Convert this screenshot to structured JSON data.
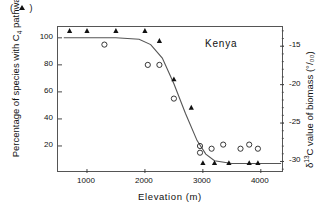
{
  "legend_marker": "( ▲ )",
  "title": "Kenya",
  "axes": {
    "x": {
      "label": "Elevation  (m)",
      "ticks": [
        "1000",
        "2000",
        "3000",
        "4000"
      ],
      "min": 500,
      "max": 4400
    },
    "y_left": {
      "label_pre": "Percentage of species with C",
      "label_sub": "4",
      "label_post": " pathway",
      "ticks": [
        "100",
        "80",
        "60",
        "40",
        "20"
      ],
      "min": 0,
      "max": 108
    },
    "y_right": {
      "label_pre": "δ",
      "label_sup": "13",
      "label_post": "C value of biomass  (°/₀₀)",
      "ticks": [
        "-15",
        "-20",
        "-25",
        "-30"
      ],
      "min": -31.5,
      "max": -12.5
    }
  },
  "chart_data": {
    "type": "scatter",
    "title": "Kenya",
    "xlabel": "Elevation (m)",
    "ylabel": "Percentage of species with C4 pathway",
    "ylabel_right": "d13C value of biomass (o/oo)",
    "xlim": [
      500,
      4400
    ],
    "ylim_left": [
      0,
      108
    ],
    "ylim_right": [
      -31.5,
      -12.5
    ],
    "grid": false,
    "legend_position": "top-left",
    "series": [
      {
        "name": "Percentage of species with C4 pathway",
        "marker": "open-circle",
        "axis": "left",
        "points": [
          [
            1300,
            95
          ],
          [
            2050,
            80
          ],
          [
            2250,
            80
          ],
          [
            2500,
            55
          ],
          [
            2950,
            20
          ],
          [
            2950,
            15
          ],
          [
            3150,
            18
          ],
          [
            3350,
            21
          ],
          [
            3650,
            18
          ],
          [
            3800,
            21
          ],
          [
            3950,
            18
          ]
        ]
      },
      {
        "name": "d13C value of biomass",
        "marker": "filled-triangle",
        "axis": "right",
        "points": [
          [
            700,
            -13.0
          ],
          [
            1000,
            -13.0
          ],
          [
            1500,
            -13.0
          ],
          [
            2000,
            -13.0
          ],
          [
            2250,
            -14.3
          ],
          [
            2500,
            -19.3
          ],
          [
            2800,
            -23.0
          ],
          [
            3000,
            -30.2
          ],
          [
            3200,
            -30.2
          ],
          [
            3450,
            -30.2
          ],
          [
            3800,
            -30.2
          ],
          [
            3950,
            -30.2
          ]
        ]
      }
    ],
    "fitted_curve": {
      "name": "sigmoid fit",
      "description": "Logistic decline of C4 percentage with elevation",
      "x": [
        600,
        1000,
        1500,
        1900,
        2100,
        2300,
        2500,
        2700,
        2900,
        3050,
        3200,
        3500,
        4000,
        4350
      ],
      "y": [
        100,
        100,
        100,
        99,
        95,
        85,
        66,
        44,
        24,
        14,
        9,
        7,
        7,
        7
      ]
    }
  }
}
